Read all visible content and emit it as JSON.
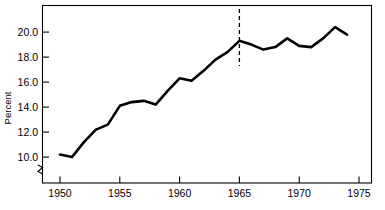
{
  "chart_data": {
    "type": "line",
    "title": "",
    "subtitle": "",
    "xlabel": "",
    "ylabel": "Percent",
    "x": [
      1950,
      1951,
      1952,
      1953,
      1954,
      1955,
      1956,
      1957,
      1958,
      1959,
      1960,
      1961,
      1962,
      1963,
      1964,
      1965,
      1966,
      1967,
      1968,
      1969,
      1970,
      1971,
      1972,
      1973,
      1974
    ],
    "values": [
      10.2,
      10.0,
      11.2,
      12.2,
      12.6,
      14.1,
      14.4,
      14.5,
      14.2,
      15.3,
      16.3,
      16.1,
      16.9,
      17.8,
      18.4,
      19.3,
      19.0,
      18.6,
      18.8,
      19.5,
      18.9,
      18.8,
      19.5,
      20.4,
      19.8
    ],
    "series": [
      {
        "name": "Percent",
        "values": [
          10.2,
          10.0,
          11.2,
          12.2,
          12.6,
          14.1,
          14.4,
          14.5,
          14.2,
          15.3,
          16.3,
          16.1,
          16.9,
          17.8,
          18.4,
          19.3,
          19.0,
          18.6,
          18.8,
          19.5,
          18.9,
          18.8,
          19.5,
          20.4,
          19.8
        ],
        "color": "#000000"
      }
    ],
    "xlim": [
      1948.5,
      1976.0
    ],
    "ylim": [
      9.0,
      21.2
    ],
    "x_ticks": [
      1950,
      1955,
      1960,
      1965,
      1970,
      1975
    ],
    "x_tick_labels": [
      "1950",
      "1955",
      "1960",
      "1965",
      "1970",
      "1975"
    ],
    "y_ticks": [
      10.0,
      12.0,
      14.0,
      16.0,
      18.0,
      20.0
    ],
    "y_tick_labels": [
      "10.0",
      "12.0",
      "14.0",
      "16.0",
      "18.0",
      "20.0"
    ],
    "grid": false,
    "legend": false,
    "legend_position": "none",
    "y_axis_break": true,
    "y_axis_break_below": 10.0,
    "annotations": [
      {
        "type": "vertical-dashed-line",
        "x": 1965,
        "label": "",
        "color": "#000000"
      }
    ],
    "frame": "box"
  },
  "axis": {
    "y_label": "Percent",
    "x_tick_labels": [
      "1950",
      "1955",
      "1960",
      "1965",
      "1970",
      "1975"
    ],
    "y_tick_labels": [
      "20.0",
      "18.0",
      "16.0",
      "14.0",
      "12.0",
      "10.0"
    ]
  }
}
